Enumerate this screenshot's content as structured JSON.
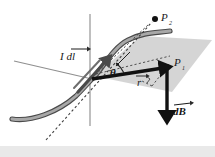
{
  "figure": {
    "background_color": "#ffffff",
    "footer_band_color": "#e9e9e9"
  },
  "labels": {
    "current_element": {
      "text": "I dl",
      "vector_accent": "arrow",
      "x": 62,
      "y": 60
    },
    "point_p2": {
      "text": "P",
      "subscript": "2",
      "x": 162,
      "y": 18
    },
    "point_p1": {
      "text": "P",
      "subscript": "1",
      "x": 176,
      "y": 64
    },
    "angle_theta": {
      "text": "θ",
      "x": 114,
      "y": 73
    },
    "radius_vector": {
      "text": "r",
      "vector_accent": "arrow",
      "x": 139,
      "y": 82
    },
    "field_vector": {
      "text": "dB",
      "vector_accent": "arrow",
      "x": 177,
      "y": 111
    }
  },
  "elements": {
    "wire": {
      "name": "current-carrying-wire",
      "color": "#8a8a8a",
      "edge_color": "#4f4f4f",
      "stroke_width": 4
    },
    "plane": {
      "name": "shaded-plane",
      "fill": "#cfcfcf",
      "opacity": 0.85
    },
    "vertical_axis": {
      "color": "#9a9a9a",
      "stroke_width": 1.2
    },
    "horizontal_axis": {
      "color": "#8f8f8f",
      "stroke_width": 1.0
    },
    "dashed_lines": {
      "color": "#4a4a4a",
      "dash_pattern": "2,2"
    },
    "r_arrow": {
      "color": "#111111",
      "stroke_width": 3.4
    },
    "dB_arrow": {
      "color": "#111111",
      "stroke_width": 3.2,
      "direction": "down"
    },
    "dl_arrow": {
      "color": "#3a3a3a",
      "stroke_width": 3.0
    }
  },
  "geometry": {
    "origin": {
      "x": 90,
      "y": 78
    },
    "p1": {
      "x": 167,
      "y": 67
    },
    "p2": {
      "x": 155,
      "y": 19
    },
    "dB_tip": {
      "x": 167,
      "y": 117
    }
  }
}
